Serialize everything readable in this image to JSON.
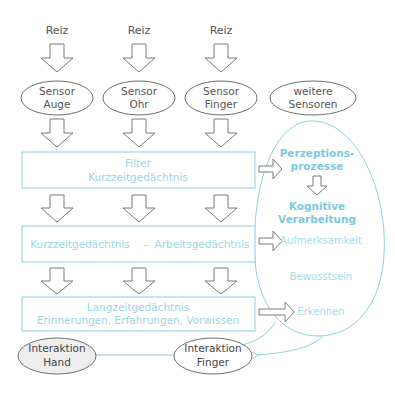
{
  "colors": {
    "gray_stroke": "#6e6e6e",
    "blue_stroke": "#8fd0e0",
    "blue_text": "#7cc8dc",
    "blue_bold_text": "#5fb7d2",
    "ellipse_fill_gray": "#eeeeee",
    "text_dark": "#444444"
  },
  "stimuli": [
    {
      "label": "Reiz"
    },
    {
      "label": "Reiz"
    },
    {
      "label": "Reiz"
    }
  ],
  "sensors": [
    {
      "line1": "Sensor",
      "line2": "Auge"
    },
    {
      "line1": "Sensor",
      "line2": "Ohr"
    },
    {
      "line1": "Sensor",
      "line2": "Finger"
    },
    {
      "line1": "weitere",
      "line2": "Sensoren"
    }
  ],
  "boxes": {
    "filter": {
      "line1": "Filter",
      "line2": "Kurzzeitgedächtnis"
    },
    "working": {
      "left": "Kurzzeitgedächtnis",
      "dash": "–",
      "right": "Arbeitsgedächtnis"
    },
    "longterm": {
      "line1": "Langzeitgedächtnis",
      "line2": "Erinnerungen, Erfahrungen, Vorwissen"
    }
  },
  "cognition": {
    "perception_line1": "Perzeptions-",
    "perception_line2": "prozesse",
    "cognitive_line1": "Kognitive",
    "cognitive_line2": "Verarbeitung",
    "attention": "Aufmerksamkeit",
    "consciousness": "Bewusstsein",
    "recognition": "Erkennen"
  },
  "interactions": {
    "hand": {
      "line1": "Interaktion",
      "line2": "Hand"
    },
    "finger": {
      "line1": "Interaktion",
      "line2": "Finger"
    }
  }
}
